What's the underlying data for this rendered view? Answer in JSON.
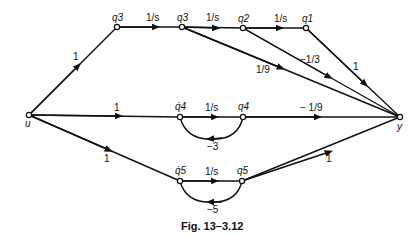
{
  "caption": "Fig. 13–3.12",
  "nodes": {
    "u": {
      "label": "u"
    },
    "q3dot": {
      "label": "q3"
    },
    "q3": {
      "label": "q3"
    },
    "q2": {
      "label": "q2"
    },
    "q1": {
      "label": "q1"
    },
    "q4dot": {
      "label": "q̇4"
    },
    "q4": {
      "label": "q4"
    },
    "q5dot": {
      "label": "q̇5"
    },
    "q5": {
      "label": "q5"
    },
    "y": {
      "label": "y"
    }
  },
  "edges": {
    "u_q3dot": "1",
    "q3dot_q3": "1/s",
    "q3_q2": "1/s",
    "q2_q1": "1/s",
    "q1_y": "1",
    "q2_y": "−1/3",
    "q3_y": "1/9",
    "u_q4dot": "1",
    "q4dot_q4": "1/s",
    "q4_y": "− 1/9",
    "q4_loop": "−3",
    "u_q5dot": "1",
    "q5dot_q5": "1/s",
    "q5_y": "1",
    "q5_loop": "−5"
  }
}
